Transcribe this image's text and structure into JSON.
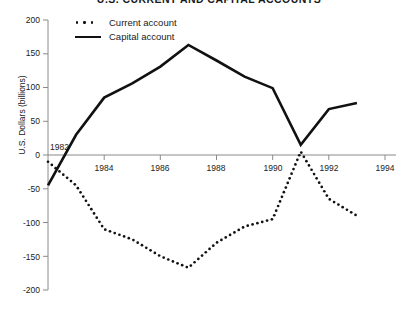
{
  "title": "U.S. CURRENT AND CAPITAL ACCOUNTS",
  "legend": {
    "current": "Current account",
    "capital": "Capital account"
  },
  "axes": {
    "ylabel": "U.S. Dollars (billions)",
    "yticks": [
      "200",
      "150",
      "100",
      "50",
      "0",
      "-50",
      "-100",
      "-150",
      "-200"
    ],
    "xticks": [
      "1984",
      "1986",
      "1988",
      "1990",
      "1992",
      "1994"
    ],
    "origin_year_label": "1982"
  },
  "colors": {
    "line": "#111111",
    "axis": "#8a8a8a",
    "text": "#1a1a1a",
    "background": "#ffffff"
  },
  "chart_data": {
    "type": "line",
    "title": "U.S. CURRENT AND CAPITAL ACCOUNTS",
    "xlabel": "",
    "ylabel": "U.S. Dollars (billions)",
    "xlim": [
      1982,
      1994
    ],
    "ylim": [
      -200,
      200
    ],
    "yticks": [
      200,
      150,
      100,
      50,
      0,
      -50,
      -100,
      -150,
      -200
    ],
    "xticks": [
      1984,
      1986,
      1988,
      1990,
      1992,
      1994
    ],
    "grid": false,
    "legend_position": "top-left-inside",
    "x": [
      1982,
      1983,
      1984,
      1985,
      1986,
      1987,
      1988,
      1989,
      1990,
      1991,
      1992,
      1993
    ],
    "series": [
      {
        "name": "Current account",
        "style": "dotted",
        "values": [
          -10,
          -45,
          -110,
          -125,
          -150,
          -167,
          -130,
          -106,
          -95,
          5,
          -65,
          -90
        ]
      },
      {
        "name": "Capital account",
        "style": "solid",
        "values": [
          -45,
          30,
          85,
          106,
          131,
          163,
          140,
          116,
          99,
          15,
          68,
          77
        ]
      }
    ]
  }
}
